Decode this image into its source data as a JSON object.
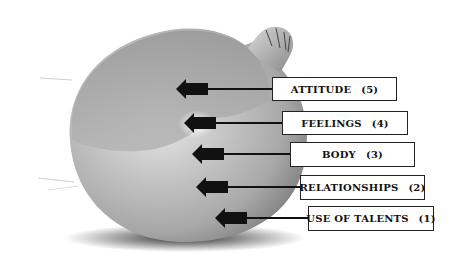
{
  "diagram": {
    "layers": [
      {
        "label": "ATTITUDE",
        "number": "(5)",
        "box": {
          "x": 272,
          "y": 77,
          "w": 125
        },
        "arrow": {
          "tip_x": 176,
          "y": 89
        }
      },
      {
        "label": "FEELINGS",
        "number": "(4)",
        "box": {
          "x": 282,
          "y": 111,
          "w": 126
        },
        "arrow": {
          "tip_x": 184,
          "y": 123
        }
      },
      {
        "label": "BODY",
        "number": "(3)",
        "box": {
          "x": 290,
          "y": 142,
          "w": 125
        },
        "arrow": {
          "tip_x": 192,
          "y": 154
        }
      },
      {
        "label": "RELATIONSHIPS",
        "number": "(2)",
        "box": {
          "x": 300,
          "y": 175,
          "w": 125
        },
        "arrow": {
          "tip_x": 196,
          "y": 187
        }
      },
      {
        "label": "USE OF TALENTS",
        "number": "(1)",
        "box": {
          "x": 308,
          "y": 206,
          "w": 126
        },
        "arrow": {
          "tip_x": 215,
          "y": 218
        }
      }
    ],
    "colors": {
      "box_border": "#222222",
      "arrow": "#111111",
      "background": "#ffffff"
    }
  }
}
